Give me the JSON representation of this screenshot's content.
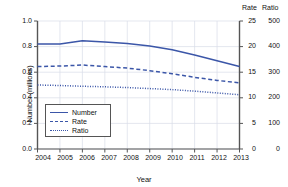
{
  "chart_data": {
    "type": "line",
    "title": "",
    "xlabel": "Year",
    "ylabel": "Number (millions)",
    "categories": [
      "2004",
      "2005",
      "2006",
      "2007",
      "2008",
      "2009",
      "2010",
      "2011",
      "2012",
      "2013"
    ],
    "x": [
      2004,
      2005,
      2006,
      2007,
      2008,
      2009,
      2010,
      2011,
      2012,
      2013
    ],
    "ylim": [
      0.0,
      1.0
    ],
    "grid": true,
    "legend_position": "lower-left-inside",
    "axes": {
      "left": {
        "label": "Number (millions)",
        "ticks": [
          "0.0",
          "0.2",
          "0.4",
          "0.6",
          "0.8",
          "1.0"
        ],
        "min": 0.0,
        "max": 1.0
      },
      "right_rate": {
        "label": "Rate",
        "ticks": [
          "0",
          "5",
          "10",
          "15",
          "20",
          "25"
        ],
        "min": 0,
        "max": 25
      },
      "right_ratio": {
        "label": "Ratio",
        "ticks": [
          "0",
          "100",
          "200",
          "300",
          "400",
          "500"
        ],
        "min": 0,
        "max": 500
      },
      "bottom": {
        "label": "Year",
        "ticks": [
          "2004",
          "2005",
          "2006",
          "2007",
          "2008",
          "2009",
          "2010",
          "2011",
          "2012",
          "2013"
        ]
      }
    },
    "series": [
      {
        "name": "Number",
        "style": "solid",
        "color": "#3b56a8",
        "axis": "left",
        "units": "millions",
        "values": [
          0.82,
          0.82,
          0.845,
          0.835,
          0.825,
          0.805,
          0.775,
          0.735,
          0.69,
          0.645
        ]
      },
      {
        "name": "Rate",
        "style": "dashed",
        "color": "#3b56a8",
        "axis": "right_rate",
        "values": [
          16.1,
          16.2,
          16.4,
          16.1,
          15.8,
          15.3,
          14.7,
          14.0,
          13.4,
          12.9
        ]
      },
      {
        "name": "Ratio",
        "style": "dotted",
        "color": "#3b56a8",
        "axis": "right_ratio",
        "values": [
          250,
          248,
          245,
          243,
          240,
          236,
          232,
          226,
          219,
          212
        ]
      }
    ],
    "legend": [
      {
        "label": "Number",
        "style": "solid"
      },
      {
        "label": "Rate",
        "style": "dashed"
      },
      {
        "label": "Ratio",
        "style": "dotted"
      }
    ]
  }
}
